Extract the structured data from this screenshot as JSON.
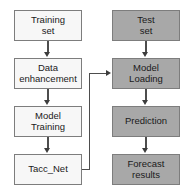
{
  "diagram": {
    "colors": {
      "light_box_fill": "#f7f7f7",
      "gray_box_fill": "#a8a8a8",
      "box_border": "#7d7d7d",
      "arrow": "#3d3d3d",
      "background": "#ffffff",
      "text": "#1a1a1a"
    },
    "columns": [
      {
        "name": "training-column",
        "style": "light",
        "nodes": [
          {
            "id": "training-set",
            "label": "Training\nset"
          },
          {
            "id": "data-enhancement",
            "label": "Data\nenhancement"
          },
          {
            "id": "model-training",
            "label": "Model\nTraining"
          },
          {
            "id": "tacc-net",
            "label": "Tacc_Net"
          }
        ]
      },
      {
        "name": "testing-column",
        "style": "gray",
        "nodes": [
          {
            "id": "test-set",
            "label": "Test\nset"
          },
          {
            "id": "model-loading",
            "label": "Model\nLoading"
          },
          {
            "id": "prediction",
            "label": "Prediction"
          },
          {
            "id": "forecast-results",
            "label": "Forecast\nresults"
          }
        ]
      }
    ],
    "edges": [
      {
        "id": "training-set-to-data-enhancement",
        "from": "training-set",
        "to": "data-enhancement",
        "kind": "vertical"
      },
      {
        "id": "data-enhancement-to-model-training",
        "from": "data-enhancement",
        "to": "model-training",
        "kind": "vertical"
      },
      {
        "id": "model-training-to-tacc-net",
        "from": "model-training",
        "to": "tacc-net",
        "kind": "vertical"
      },
      {
        "id": "tacc-net-to-model-loading",
        "from": "tacc-net",
        "to": "model-loading",
        "kind": "elbow"
      },
      {
        "id": "test-set-to-model-loading",
        "from": "test-set",
        "to": "model-loading",
        "kind": "vertical"
      },
      {
        "id": "model-loading-to-prediction",
        "from": "model-loading",
        "to": "prediction",
        "kind": "vertical"
      },
      {
        "id": "prediction-to-forecast-results",
        "from": "prediction",
        "to": "forecast-results",
        "kind": "vertical"
      }
    ]
  }
}
